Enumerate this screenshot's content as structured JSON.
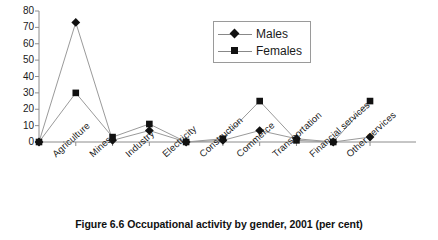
{
  "caption": "Figure 6.6 Occupational activity by gender, 2001 (per cent)",
  "legend": {
    "position": "inside-top-right",
    "entries": [
      {
        "label": "Males",
        "marker": "diamond-marker-icon",
        "color": "#111111"
      },
      {
        "label": "Females",
        "marker": "square-marker-icon",
        "color": "#111111"
      }
    ]
  },
  "axis": {
    "y_ticks": [
      "80",
      "70",
      "60",
      "50",
      "40",
      "30",
      "20",
      "10",
      "0"
    ],
    "x_labels": [
      "Agriculture",
      "Mines",
      "Industry",
      "Electricity",
      "Construction",
      "Commerce",
      "Transportation",
      "Financial services",
      "Other services"
    ]
  },
  "chart_data": {
    "type": "line",
    "title": "Figure 6.6 Occupational activity by gender, 2001 (per cent)",
    "xlabel": "",
    "ylabel": "",
    "ylim": [
      0,
      80
    ],
    "ytick_step": 10,
    "grid": false,
    "legend_position": "inside-top-right",
    "categories": [
      "",
      "Agriculture",
      "Mines",
      "Industry",
      "Electricity",
      "Construction",
      "Commerce",
      "Transportation",
      "Financial services",
      "Other services"
    ],
    "series": [
      {
        "name": "Males",
        "marker": "diamond",
        "color": "#111111",
        "values": [
          0,
          73,
          1,
          7,
          0,
          1,
          7,
          2,
          0,
          3
        ]
      },
      {
        "name": "Females",
        "marker": "square",
        "color": "#111111",
        "values": [
          0,
          30,
          3,
          11,
          0,
          2,
          25,
          1,
          0,
          25
        ]
      }
    ]
  }
}
